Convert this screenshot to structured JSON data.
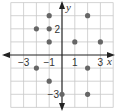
{
  "chart_data": {
    "type": "scatter",
    "title": "",
    "xlabel": "x",
    "ylabel": "y",
    "xlim": [
      -4,
      4
    ],
    "ylim": [
      -4,
      4
    ],
    "grid": true,
    "x_tick_labels": [
      {
        "value": -3,
        "label": "−3"
      },
      {
        "value": -1,
        "label": "−1"
      },
      {
        "value": 1,
        "label": "1"
      },
      {
        "value": 3,
        "label": "3"
      }
    ],
    "y_tick_labels": [
      {
        "value": 2,
        "label": "2"
      },
      {
        "value": -3,
        "label": "−3"
      }
    ],
    "points": [
      {
        "x": -1,
        "y": 3
      },
      {
        "x": 2,
        "y": 3
      },
      {
        "x": -2,
        "y": 2
      },
      {
        "x": -1,
        "y": 2
      },
      {
        "x": -1,
        "y": 1
      },
      {
        "x": 1,
        "y": 1
      },
      {
        "x": 3,
        "y": 1
      },
      {
        "x": -2,
        "y": -1
      },
      {
        "x": 2,
        "y": -1
      },
      {
        "x": -1,
        "y": -2
      },
      {
        "x": 0,
        "y": -3
      },
      {
        "x": 2,
        "y": -3
      }
    ],
    "colors": {
      "grid": "#c8c8c8",
      "axis": "#222222",
      "point": "#666666"
    }
  }
}
